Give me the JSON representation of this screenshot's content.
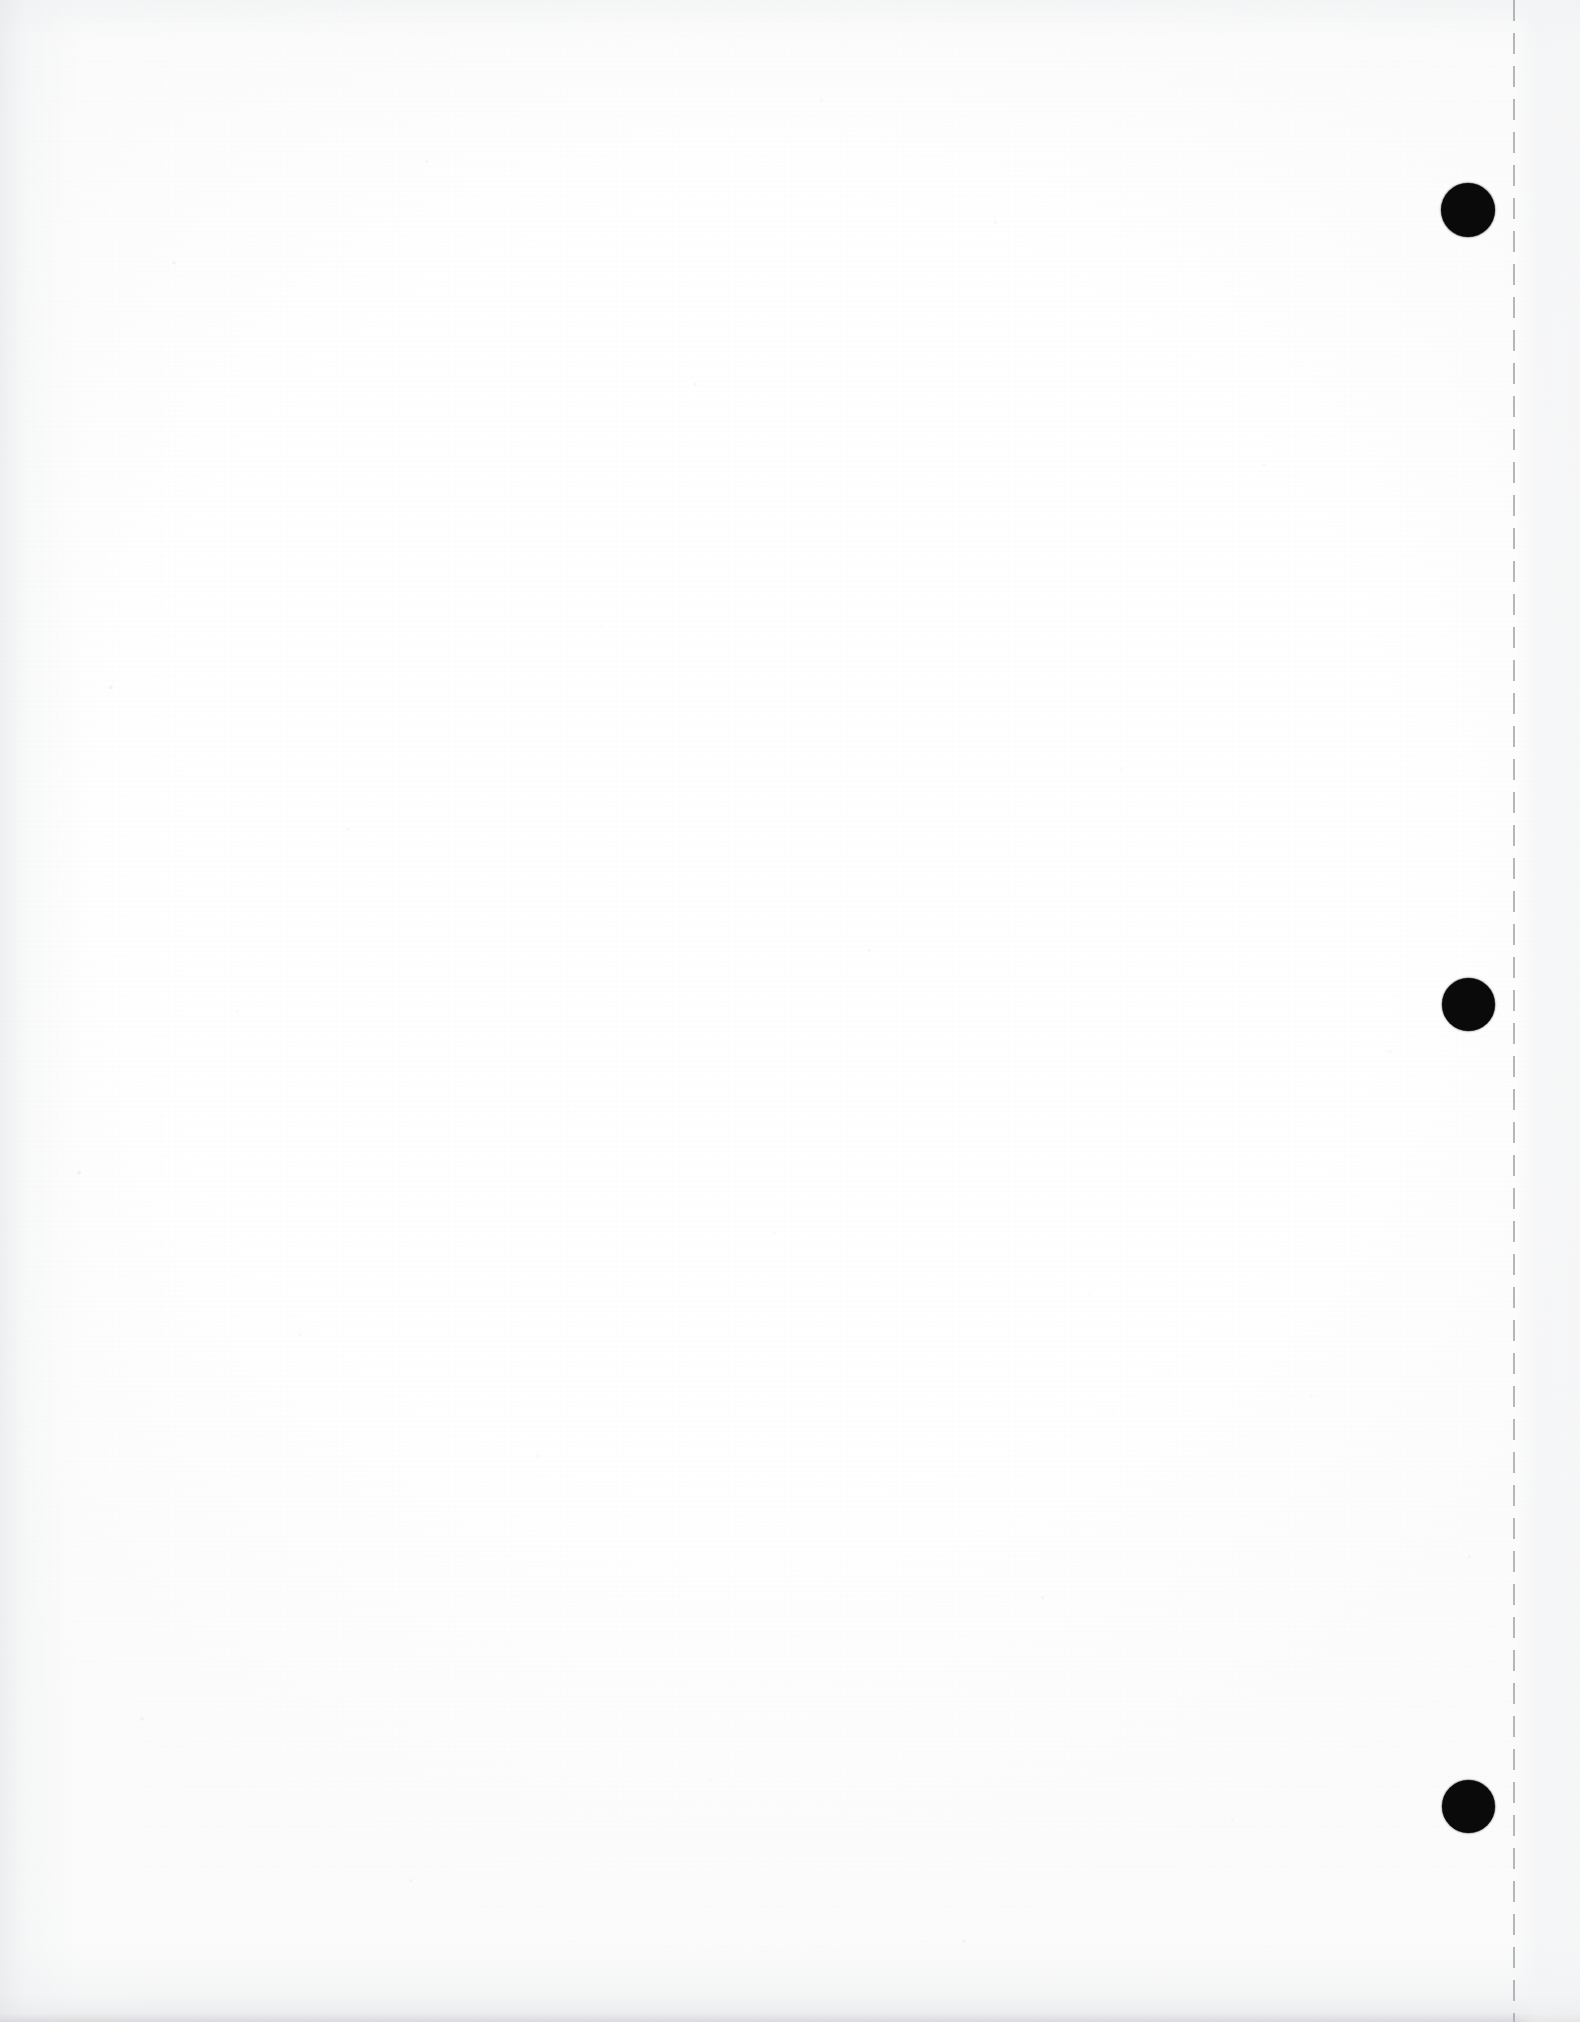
{
  "document": {
    "kind": "scanned-page",
    "page_state": "blank",
    "orientation": "portrait",
    "width_px": 1580,
    "height_px": 2022,
    "visible_text": "",
    "description_label": "Blank scanned page with three-hole punch margin"
  },
  "colors": {
    "page_background": "#ffffff",
    "paper_tint": "#fdfdfd",
    "punch_hole": "#0a0a0a",
    "perforation_line": "#a8abaf",
    "edge_shadow": "#cdd0d3",
    "outer_margin_tint": "#f1f2f4"
  },
  "margin": {
    "name": "right-punch-margin",
    "perforation": {
      "name": "perforation-guide-line",
      "style": "dashed",
      "orientation": "vertical",
      "x_px": 1514,
      "thickness_px": 2,
      "dash_length_px": 21,
      "gap_length_px": 12,
      "top_px": 0,
      "bottom_px": 2022
    },
    "outer_strip": {
      "name": "outer-margin-strip",
      "left_px": 1514,
      "width_px": 66
    }
  },
  "punch_holes": [
    {
      "id": 1,
      "name": "punch-hole-top",
      "center_x_px": 1468,
      "center_y_px": 210,
      "diameter_px": 54
    },
    {
      "id": 2,
      "name": "punch-hole-middle",
      "center_x_px": 1468,
      "center_y_px": 1004,
      "diameter_px": 53
    },
    {
      "id": 3,
      "name": "punch-hole-bottom",
      "center_x_px": 1468,
      "center_y_px": 1806,
      "diameter_px": 53
    }
  ],
  "scan_artifacts": {
    "left_edge_shadow": true,
    "bottom_edge_shadow": true,
    "top_edge_shadow": true,
    "paper_speckle": true
  }
}
